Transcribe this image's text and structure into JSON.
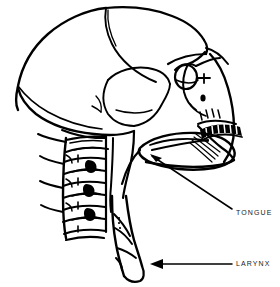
{
  "diagram": {
    "style": "black-and-white line drawing",
    "background_color": "#ffffff",
    "ink_color": "#000000",
    "width": 280,
    "height": 287
  },
  "labels": [
    {
      "id": "tongue",
      "text": "TONGUE",
      "text_x": 236,
      "text_y": 213,
      "arrow": {
        "from_x": 232,
        "from_y": 209,
        "to_x": 150,
        "to_y": 155,
        "head": "arrowhead-tongue"
      }
    },
    {
      "id": "larynx",
      "text": "LARYNX",
      "text_x": 236,
      "text_y": 264,
      "arrow": {
        "from_x": 232,
        "from_y": 264,
        "to_x": 152,
        "to_y": 264,
        "head": "arrowhead-larynx"
      }
    }
  ],
  "structures": [
    {
      "id": "cranium",
      "name": "cranial vault"
    },
    {
      "id": "coronal-suture",
      "name": "coronal suture"
    },
    {
      "id": "temporal-bone",
      "name": "temporal bone"
    },
    {
      "id": "occipital-bone",
      "name": "occipital bone"
    },
    {
      "id": "orbit",
      "name": "orbit / eye socket"
    },
    {
      "id": "zygomatic-arch",
      "name": "zygomatic arch"
    },
    {
      "id": "nasal-aperture",
      "name": "nasal aperture"
    },
    {
      "id": "maxilla-teeth",
      "name": "upper teeth / maxilla"
    },
    {
      "id": "mandible",
      "name": "mandible"
    },
    {
      "id": "tongue-body",
      "name": "tongue"
    },
    {
      "id": "cervical-vertebrae",
      "name": "cervical vertebrae"
    },
    {
      "id": "larynx-trachea",
      "name": "larynx and trachea"
    }
  ]
}
